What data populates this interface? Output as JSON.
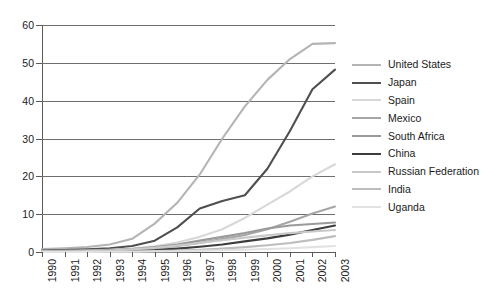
{
  "chart_data": {
    "type": "line",
    "title": "",
    "xlabel": "",
    "ylabel": "",
    "grid": true,
    "legend_position": "right",
    "ylim": [
      0,
      60
    ],
    "yticks": [
      0,
      10,
      20,
      30,
      40,
      50,
      60
    ],
    "categories": [
      "1990",
      "1991",
      "1992",
      "1993",
      "1994",
      "1995",
      "1996",
      "1997",
      "1998",
      "1999",
      "2000",
      "2001",
      "2002",
      "2003"
    ],
    "x": [
      1990,
      1991,
      1992,
      1993,
      1994,
      1995,
      1996,
      1997,
      1998,
      1999,
      2000,
      2001,
      2002,
      2003
    ],
    "series": [
      {
        "name": "United States",
        "color": "#b4b4b4",
        "values": [
          0.8,
          1.0,
          1.3,
          2.0,
          3.5,
          7.5,
          13.0,
          20.5,
          30.0,
          38.5,
          45.5,
          51.0,
          55.0,
          55.2
        ]
      },
      {
        "name": "Japan",
        "color": "#4f4f4f",
        "values": [
          0.4,
          0.5,
          0.7,
          1.0,
          1.6,
          3.0,
          6.5,
          11.5,
          13.5,
          15.0,
          22.0,
          32.0,
          43.0,
          48.2
        ]
      },
      {
        "name": "Spain",
        "color": "#d8d8d8",
        "values": [
          0.2,
          0.3,
          0.4,
          0.6,
          0.9,
          1.5,
          2.5,
          4.0,
          6.0,
          9.0,
          12.5,
          16.0,
          20.0,
          23.2
        ]
      },
      {
        "name": "Mexico",
        "color": "#a6a6a6",
        "values": [
          0.1,
          0.2,
          0.3,
          0.4,
          0.6,
          1.0,
          1.6,
          2.4,
          3.4,
          4.5,
          6.0,
          8.0,
          10.2,
          12.0
        ]
      },
      {
        "name": "South Africa",
        "color": "#9a9a9a",
        "values": [
          0.1,
          0.2,
          0.3,
          0.5,
          0.8,
          1.3,
          2.0,
          3.0,
          4.0,
          5.0,
          6.2,
          7.0,
          7.4,
          7.8
        ]
      },
      {
        "name": "China",
        "color": "#3d3d3d",
        "values": [
          0.05,
          0.08,
          0.1,
          0.15,
          0.25,
          0.5,
          0.9,
          1.4,
          2.0,
          2.8,
          3.6,
          4.6,
          5.8,
          7.0
        ]
      },
      {
        "name": "Russian Federation",
        "color": "#c9c9c9",
        "values": [
          0.1,
          0.15,
          0.25,
          0.4,
          0.7,
          1.1,
          1.7,
          2.4,
          3.1,
          3.8,
          4.4,
          5.0,
          5.4,
          5.8
        ]
      },
      {
        "name": "India",
        "color": "#bdbdbd",
        "values": [
          0.05,
          0.06,
          0.08,
          0.1,
          0.15,
          0.25,
          0.4,
          0.6,
          0.9,
          1.3,
          1.8,
          2.4,
          3.2,
          4.2
        ]
      },
      {
        "name": "Uganda",
        "color": "#e2e2e2",
        "values": [
          0.02,
          0.03,
          0.04,
          0.05,
          0.08,
          0.12,
          0.2,
          0.3,
          0.45,
          0.6,
          0.8,
          1.0,
          1.3,
          1.6
        ]
      }
    ]
  },
  "legend": {
    "items": [
      {
        "label": "United States"
      },
      {
        "label": "Japan"
      },
      {
        "label": "Spain"
      },
      {
        "label": "Mexico"
      },
      {
        "label": "South Africa"
      },
      {
        "label": "China"
      },
      {
        "label": "Russian Federation"
      },
      {
        "label": "India"
      },
      {
        "label": "Uganda"
      }
    ]
  },
  "colors": {
    "grid": "#6e6e6e",
    "axis": "#5a5a5a",
    "text": "#1a1a1a",
    "background": "#ffffff"
  }
}
